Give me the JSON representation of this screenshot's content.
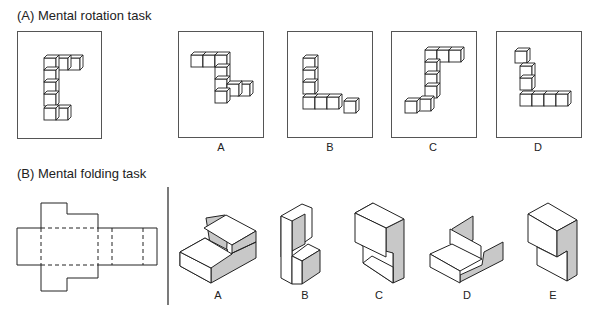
{
  "section_a": {
    "title": "(A) Mental rotation task",
    "options": [
      {
        "label": "A"
      },
      {
        "label": "B"
      },
      {
        "label": "C"
      },
      {
        "label": "D"
      }
    ]
  },
  "section_b": {
    "title": "(B) Mental folding task",
    "options": [
      {
        "label": "A"
      },
      {
        "label": "B"
      },
      {
        "label": "C"
      },
      {
        "label": "D"
      },
      {
        "label": "E"
      }
    ]
  },
  "colors": {
    "line": "#222222",
    "shade": "#c8c8c8",
    "frame": "#555555"
  }
}
